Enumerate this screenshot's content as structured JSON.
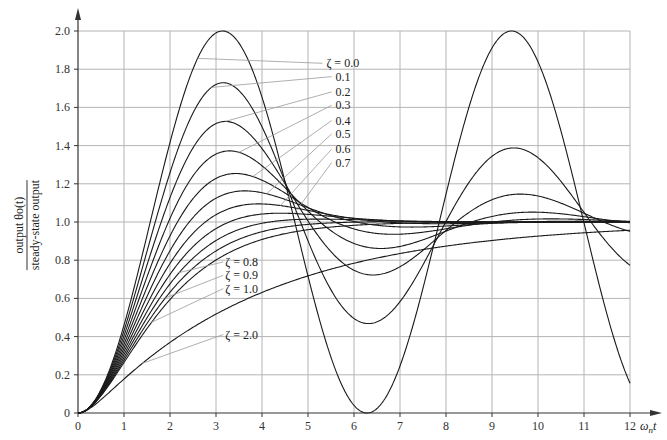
{
  "chart_data": {
    "type": "line",
    "title": "",
    "xlabel": "ωnt",
    "ylabel": "output θo(t) / steady-state output",
    "ylabel_numerator": "output θo(t)",
    "ylabel_denominator": "steady-state output",
    "xlim": [
      0,
      12
    ],
    "ylim": [
      0,
      2.0
    ],
    "grid": true,
    "x_ticks": [
      "0",
      "1",
      "2",
      "3",
      "4",
      "5",
      "6",
      "7",
      "8",
      "9",
      "10",
      "11",
      "12"
    ],
    "y_ticks": [
      "0",
      "0.2",
      "0.4",
      "0.6",
      "0.8",
      "1.0",
      "1.2",
      "1.4",
      "1.6",
      "1.8",
      "2.0"
    ],
    "formula": "underdamped: 1 - e^(-ζt)/sqrt(1-ζ²)·sin(sqrt(1-ζ²)t + acos ζ); ζ=1: 1-(1+t)e^-t; ζ>1: overdamped",
    "series": [
      {
        "name": "ζ = 0.0",
        "zeta": 0.0,
        "peak": 2.0,
        "peak_x": 3.14
      },
      {
        "name": "0.1",
        "zeta": 0.1,
        "peak": 1.73,
        "peak_x": 3.16
      },
      {
        "name": "0.2",
        "zeta": 0.2,
        "peak": 1.53,
        "peak_x": 3.21
      },
      {
        "name": "0.3",
        "zeta": 0.3,
        "peak": 1.37,
        "peak_x": 3.29
      },
      {
        "name": "0.4",
        "zeta": 0.4,
        "peak": 1.25,
        "peak_x": 3.43
      },
      {
        "name": "0.5",
        "zeta": 0.5,
        "peak": 1.16,
        "peak_x": 3.63
      },
      {
        "name": "0.6",
        "zeta": 0.6,
        "peak": 1.09,
        "peak_x": 3.93
      },
      {
        "name": "0.7",
        "zeta": 0.7,
        "peak": 1.05,
        "peak_x": 4.4
      },
      {
        "name": "ζ = 0.8",
        "zeta": 0.8
      },
      {
        "name": "ζ = 0.9",
        "zeta": 0.9
      },
      {
        "name": "ζ = 1.0",
        "zeta": 1.0
      },
      {
        "name": "ζ = 2.0",
        "zeta": 2.0
      }
    ],
    "annotations": [
      {
        "text": "ζ = 0.0",
        "x": 5.4,
        "y": 1.81
      },
      {
        "text": "0.1",
        "x": 5.6,
        "y": 1.74
      },
      {
        "text": "0.2",
        "x": 5.6,
        "y": 1.66
      },
      {
        "text": "0.3",
        "x": 5.6,
        "y": 1.59
      },
      {
        "text": "0.4",
        "x": 5.6,
        "y": 1.51
      },
      {
        "text": "0.5",
        "x": 5.6,
        "y": 1.44
      },
      {
        "text": "0.6",
        "x": 5.6,
        "y": 1.36
      },
      {
        "text": "0.7",
        "x": 5.6,
        "y": 1.29
      },
      {
        "text": "ζ = 0.8",
        "x": 3.2,
        "y": 0.77
      },
      {
        "text": "ζ = 0.9",
        "x": 3.2,
        "y": 0.7
      },
      {
        "text": "ζ = 1.0",
        "x": 3.2,
        "y": 0.63
      },
      {
        "text": "ζ = 2.0",
        "x": 3.2,
        "y": 0.39
      }
    ]
  },
  "colors": {
    "curve": "#1a1a1a",
    "grid": "#b4b4b4",
    "axis": "#333333",
    "leader": "#9a9a9a"
  }
}
